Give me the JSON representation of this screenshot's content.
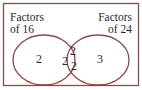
{
  "diagram": {
    "type": "venn",
    "colors": {
      "stroke": "#8a4a4a",
      "text": "#2a2a2a"
    },
    "sets": [
      {
        "label_line1": "Factors",
        "label_line2": "of 16",
        "only_values": [
          "2"
        ]
      },
      {
        "label_line1": "Factors",
        "label_line2": "of 24",
        "only_values": [
          "3"
        ]
      }
    ],
    "intersection": [
      "2",
      "2",
      "2"
    ]
  }
}
